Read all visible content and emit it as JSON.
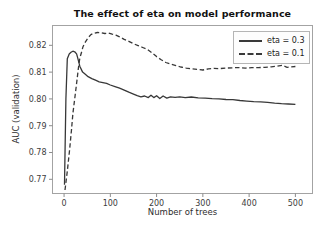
{
  "chart_data": {
    "type": "line",
    "title": "The effect of eta on model performance",
    "xlabel": "Number of trees",
    "ylabel": "AUC (validation)",
    "xlim": [
      -25,
      537
    ],
    "ylim": [
      0.7647,
      0.8274
    ],
    "x_ticks": [
      0,
      100,
      200,
      300,
      400,
      500
    ],
    "x_tick_labels": [
      "0",
      "100",
      "200",
      "300",
      "400",
      "500"
    ],
    "y_ticks": [
      0.77,
      0.78,
      0.79,
      0.8,
      0.81,
      0.82
    ],
    "y_tick_labels": [
      "0.77",
      "0.78",
      "0.79",
      "0.80",
      "0.81",
      "0.82"
    ],
    "grid": false,
    "legend_position": "upper right",
    "colors": {
      "line": "#383838",
      "frame": "#a3a3a3",
      "tick": "#8c8c8c",
      "tick_text": "#3d3d3d",
      "legend_border": "#b5b5b5",
      "legend_bg": "#fdfdfd"
    },
    "series": [
      {
        "name": "eta = 0.3",
        "style": "solid",
        "color": "#383838",
        "x": [
          1,
          4,
          7,
          11,
          15,
          19,
          23,
          27,
          30,
          34,
          40,
          46,
          52,
          60,
          68,
          76,
          84,
          92,
          100,
          110,
          120,
          130,
          140,
          150,
          158,
          166,
          174,
          182,
          188,
          194,
          200,
          207,
          214,
          222,
          230,
          240,
          250,
          262,
          275,
          290,
          305,
          320,
          335,
          350,
          365,
          380,
          395,
          410,
          425,
          440,
          455,
          470,
          485,
          500
        ],
        "y": [
          0.768,
          0.8,
          0.815,
          0.8168,
          0.8174,
          0.8178,
          0.8176,
          0.8168,
          0.815,
          0.8122,
          0.81,
          0.8092,
          0.8083,
          0.8076,
          0.807,
          0.8064,
          0.8061,
          0.8058,
          0.8052,
          0.8046,
          0.804,
          0.8033,
          0.8025,
          0.8018,
          0.8012,
          0.8008,
          0.8011,
          0.8005,
          0.8014,
          0.8005,
          0.8012,
          0.8001,
          0.8011,
          0.8003,
          0.8008,
          0.8006,
          0.8008,
          0.8005,
          0.8007,
          0.8004,
          0.8003,
          0.8001,
          0.8,
          0.7998,
          0.7997,
          0.7994,
          0.7992,
          0.799,
          0.7989,
          0.7987,
          0.7984,
          0.7982,
          0.7981,
          0.798
        ]
      },
      {
        "name": "eta = 0.1",
        "style": "dashed",
        "color": "#383838",
        "x": [
          2,
          7,
          12,
          16,
          19,
          23,
          27,
          31,
          34,
          38,
          41,
          46,
          52,
          58,
          64,
          72,
          80,
          88,
          96,
          104,
          112,
          120,
          130,
          140,
          150,
          160,
          170,
          180,
          190,
          200,
          210,
          220,
          230,
          240,
          252,
          264,
          276,
          288,
          300,
          312,
          324,
          336,
          350,
          364,
          378,
          392,
          406,
          420,
          434,
          448,
          460,
          472,
          482,
          491,
          500
        ],
        "y": [
          0.766,
          0.773,
          0.781,
          0.7885,
          0.7946,
          0.8,
          0.8058,
          0.8115,
          0.8152,
          0.8175,
          0.8195,
          0.8212,
          0.8228,
          0.824,
          0.8245,
          0.8248,
          0.8247,
          0.8244,
          0.8246,
          0.8242,
          0.8238,
          0.8232,
          0.8222,
          0.8215,
          0.8206,
          0.8199,
          0.8192,
          0.8185,
          0.8172,
          0.8158,
          0.8146,
          0.8136,
          0.813,
          0.8125,
          0.8119,
          0.8115,
          0.8112,
          0.811,
          0.8108,
          0.8112,
          0.8114,
          0.8113,
          0.8115,
          0.8116,
          0.8117,
          0.8115,
          0.8117,
          0.8117,
          0.8118,
          0.812,
          0.8122,
          0.8125,
          0.8118,
          0.812,
          0.8121
        ]
      }
    ]
  }
}
